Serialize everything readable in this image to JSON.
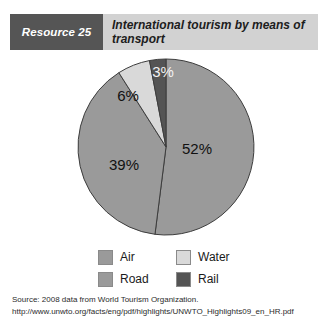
{
  "header": {
    "badge_label": "Resource 25",
    "title": "International  tourism by means of transport",
    "badge_color": "#555555",
    "band_color": "#d2d2d2"
  },
  "chart_data": {
    "type": "pie",
    "title": "International  tourism by means of transport",
    "categories": [
      "Air",
      "Road",
      "Water",
      "Rail"
    ],
    "values": [
      52,
      39,
      6,
      3
    ],
    "unit": "%",
    "data_labels": [
      "52%",
      "39%",
      "6%",
      "3%"
    ],
    "colors": [
      "#9a9a9a",
      "#9a9a9a",
      "#d9d9d9",
      "#545454"
    ],
    "legend_position": "bottom",
    "grid": false,
    "start_angle_deg": 0,
    "direction": "clockwise"
  },
  "legend": {
    "items": [
      {
        "label": "Air",
        "color": "#9a9a9a"
      },
      {
        "label": "Water",
        "color": "#d9d9d9"
      },
      {
        "label": "Road",
        "color": "#9a9a9a"
      },
      {
        "label": "Rail",
        "color": "#545454"
      }
    ]
  },
  "source": {
    "line1": "Source: 2008 data from World Tourism Organization.",
    "line2": "http://www.unwto.org/facts/eng/pdf/highlights/UNWTO_Highlights09_en_HR.pdf"
  }
}
